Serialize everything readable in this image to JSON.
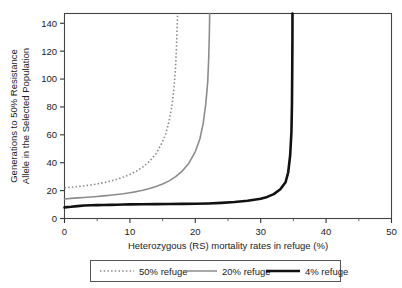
{
  "chart_data": {
    "type": "line",
    "title": "",
    "xlabel": "Heterozygous (RS) mortality rates in refuge (%)",
    "ylabel": "Generations to 50% Resistance Allele in the Selected Population",
    "ylabel_line1": "Generations to 50% Resistance",
    "ylabel_line2": "Allele in the Selected Population",
    "xlim": [
      0,
      50
    ],
    "ylim": [
      0,
      147
    ],
    "xticks": [
      0,
      10,
      20,
      30,
      40,
      50
    ],
    "yticks": [
      0,
      20,
      40,
      60,
      80,
      100,
      120,
      140
    ],
    "xtick_labels": [
      "0",
      "10",
      "20",
      "30",
      "40",
      "50"
    ],
    "ytick_labels": [
      "0",
      "20",
      "40",
      "60",
      "80",
      "100",
      "120",
      "140"
    ],
    "grid": false,
    "legend_position": "below-axes",
    "minor_xticks": [
      5,
      15,
      25,
      35,
      45
    ],
    "series": [
      {
        "name": "50% refuge",
        "style": "dotted",
        "color": "#8c8c8c",
        "width": 1.6,
        "asymptote_x": 17.3,
        "points": [
          [
            0,
            22.0
          ],
          [
            1,
            22.4
          ],
          [
            2,
            22.9
          ],
          [
            3,
            23.4
          ],
          [
            4,
            24.0
          ],
          [
            5,
            24.8
          ],
          [
            6,
            25.7
          ],
          [
            7,
            26.8
          ],
          [
            8,
            28.1
          ],
          [
            9,
            29.7
          ],
          [
            10,
            31.6
          ],
          [
            11,
            34.0
          ],
          [
            12,
            37.0
          ],
          [
            13,
            41.0
          ],
          [
            14,
            46.5
          ],
          [
            15,
            55.0
          ],
          [
            15.5,
            61.0
          ],
          [
            16,
            70.0
          ],
          [
            16.4,
            80.0
          ],
          [
            16.7,
            92.0
          ],
          [
            16.95,
            106.0
          ],
          [
            17.1,
            120.0
          ],
          [
            17.2,
            134.0
          ],
          [
            17.3,
            147.0
          ]
        ]
      },
      {
        "name": "20% refuge",
        "style": "solid",
        "color": "#8c8c8c",
        "width": 1.6,
        "asymptote_x": 22.2,
        "points": [
          [
            0,
            14.0
          ],
          [
            1,
            14.4
          ],
          [
            2,
            14.8
          ],
          [
            3,
            15.1
          ],
          [
            4,
            15.4
          ],
          [
            5,
            15.8
          ],
          [
            6,
            16.2
          ],
          [
            7,
            16.7
          ],
          [
            8,
            17.2
          ],
          [
            9,
            17.8
          ],
          [
            10,
            18.5
          ],
          [
            11,
            19.3
          ],
          [
            12,
            20.3
          ],
          [
            13,
            21.5
          ],
          [
            14,
            23.0
          ],
          [
            15,
            24.8
          ],
          [
            16,
            27.0
          ],
          [
            17,
            30.0
          ],
          [
            18,
            34.0
          ],
          [
            19,
            39.5
          ],
          [
            20,
            48.0
          ],
          [
            20.7,
            57.0
          ],
          [
            21.2,
            68.0
          ],
          [
            21.6,
            82.0
          ],
          [
            21.9,
            98.0
          ],
          [
            22.05,
            115.0
          ],
          [
            22.15,
            132.0
          ],
          [
            22.2,
            147.0
          ]
        ]
      },
      {
        "name": "4% refuge",
        "style": "solid",
        "color": "#111111",
        "width": 2.6,
        "asymptote_x": 34.8,
        "points": [
          [
            0,
            8.0
          ],
          [
            1,
            8.4
          ],
          [
            2,
            8.9
          ],
          [
            3,
            9.3
          ],
          [
            4,
            9.5
          ],
          [
            5,
            9.6
          ],
          [
            6,
            9.7
          ],
          [
            7,
            9.8
          ],
          [
            8,
            9.9
          ],
          [
            9,
            10.0
          ],
          [
            10,
            10.1
          ],
          [
            12,
            10.2
          ],
          [
            14,
            10.3
          ],
          [
            16,
            10.4
          ],
          [
            18,
            10.5
          ],
          [
            20,
            10.6
          ],
          [
            22,
            10.8
          ],
          [
            24,
            11.2
          ],
          [
            26,
            11.8
          ],
          [
            28,
            12.7
          ],
          [
            30,
            14.2
          ],
          [
            31,
            15.5
          ],
          [
            32,
            17.5
          ],
          [
            33,
            21.0
          ],
          [
            33.8,
            26.0
          ],
          [
            34.2,
            33.0
          ],
          [
            34.5,
            45.0
          ],
          [
            34.7,
            62.0
          ],
          [
            34.78,
            82.0
          ],
          [
            34.82,
            105.0
          ],
          [
            34.85,
            128.0
          ],
          [
            34.86,
            147.0
          ]
        ]
      }
    ],
    "legend": [
      {
        "label": "50% refuge",
        "style": "dotted",
        "color": "#8c8c8c"
      },
      {
        "label": "20% refuge",
        "style": "solid",
        "color": "#8c8c8c"
      },
      {
        "label": "4% refuge",
        "style": "solid-thick",
        "color": "#111111"
      }
    ]
  }
}
